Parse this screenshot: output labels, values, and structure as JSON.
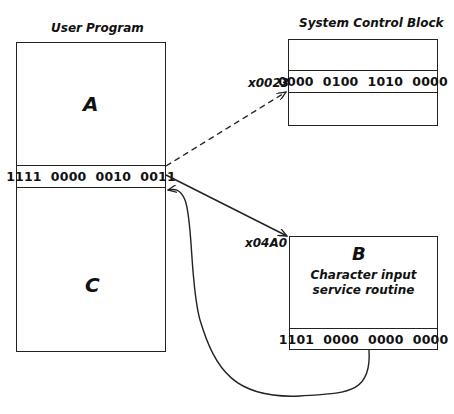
{
  "user_program": {
    "title": "User Program",
    "region_top_label": "A",
    "instruction": "1111  0000  0010  0011",
    "region_bottom_label": "C"
  },
  "system_control_block": {
    "title": "System Control Block",
    "address": "x0023",
    "entry": "0000  0100  1010  0000"
  },
  "service_routine": {
    "address": "x04A0",
    "label": "B",
    "description_line1": "Character input",
    "description_line2": "service routine",
    "return_instruction": "1101  0000  0000  0000"
  },
  "arrows": [
    {
      "from": "trap-instruction",
      "to": "system-control-block-entry",
      "style": "dashed"
    },
    {
      "from": "trap-instruction",
      "to": "service-routine-start",
      "style": "solid"
    },
    {
      "from": "return-instruction",
      "to": "user-program-after-trap",
      "style": "solid-curve"
    }
  ],
  "colors": {
    "line": "#222222",
    "background": "#ffffff"
  }
}
